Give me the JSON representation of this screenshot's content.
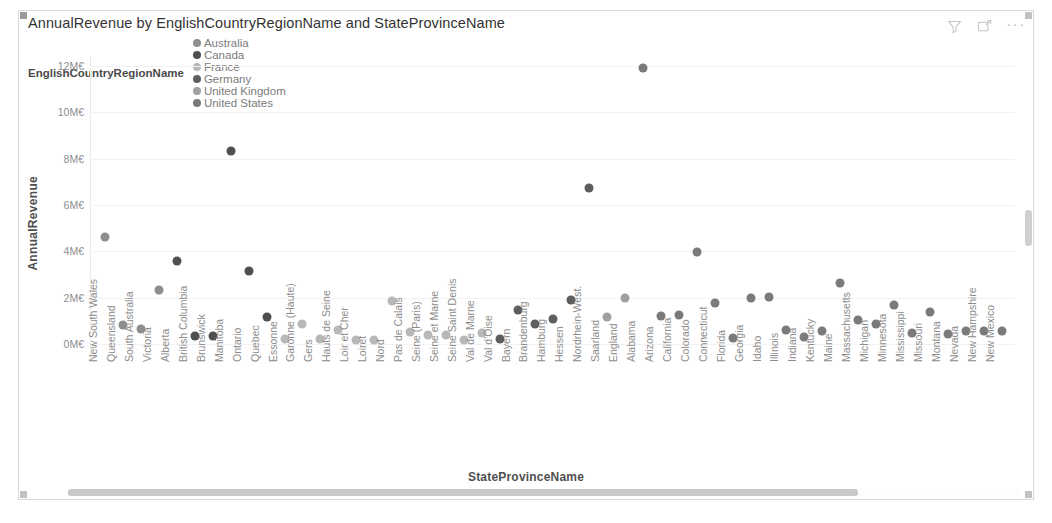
{
  "visual": {
    "title": "AnnualRevenue by EnglishCountryRegionName and StateProvinceName",
    "header_actions": [
      {
        "name": "filter-icon",
        "label": "Filters"
      },
      {
        "name": "focus-mode-icon",
        "label": "Focus mode"
      },
      {
        "name": "more-options-icon",
        "label": "···"
      }
    ]
  },
  "legend": {
    "title": "EnglishCountryRegionName",
    "items": [
      {
        "label": "Australia",
        "color": "#8e8e8e"
      },
      {
        "label": "Canada",
        "color": "#4f4f4f"
      },
      {
        "label": "France",
        "color": "#b8b8b8"
      },
      {
        "label": "Germany",
        "color": "#5e5e5e"
      },
      {
        "label": "United Kingdom",
        "color": "#a0a0a0"
      },
      {
        "label": "United States",
        "color": "#7a7a7a"
      }
    ]
  },
  "scrollbars": {
    "horizontal_visible": true,
    "vertical_visible": true
  },
  "chart_data": {
    "type": "scatter",
    "title": "AnnualRevenue by EnglishCountryRegionName and StateProvinceName",
    "xlabel": "StateProvinceName",
    "ylabel": "AnnualRevenue",
    "grid": true,
    "legend_position": "top",
    "ylim": [
      0,
      12000000
    ],
    "ytick_labels": [
      "0M€",
      "2M€",
      "4M€",
      "6M€",
      "8M€",
      "10M€",
      "12M€"
    ],
    "ytick_values": [
      0,
      2000000,
      4000000,
      6000000,
      8000000,
      10000000,
      12000000
    ],
    "categories": [
      "New South Wales",
      "Queensland",
      "South Australia",
      "Victoria",
      "Alberta",
      "British Columbia",
      "Brunswick",
      "Manitoba",
      "Ontario",
      "Quebec",
      "Essonne",
      "Garonne (Haute)",
      "Gers",
      "Hauts de Seine",
      "Loir et Cher",
      "Loiret",
      "Nord",
      "Pas de Calais",
      "Seine (Paris)",
      "Seine et Marne",
      "Seine Saint Denis",
      "Val de Marne",
      "Val d'Oise",
      "Bayern",
      "Brandenburg",
      "Hamburg",
      "Hessen",
      "Nordrhein-West.",
      "Saarland",
      "England",
      "Alabama",
      "Arizona",
      "California",
      "Colorado",
      "Connecticut",
      "Florida",
      "Georgia",
      "Idaho",
      "Illinois",
      "Indiana",
      "Kentucky",
      "Maine",
      "Massachusetts",
      "Michigan",
      "Minnesota",
      "Mississippi",
      "Missouri",
      "Montana",
      "Nevada",
      "New Hampshire",
      "New Mexico"
    ],
    "series": [
      {
        "name": "Australia",
        "color": "#8e8e8e",
        "points": [
          {
            "x": "New South Wales",
            "y": 4600000
          },
          {
            "x": "Queensland",
            "y": 800000
          },
          {
            "x": "South Australia",
            "y": 660000
          },
          {
            "x": "Victoria",
            "y": 2350000
          }
        ]
      },
      {
        "name": "Canada",
        "color": "#4f4f4f",
        "points": [
          {
            "x": "Alberta",
            "y": 3570000
          },
          {
            "x": "British Columbia",
            "y": 330000
          },
          {
            "x": "Brunswick",
            "y": 330000
          },
          {
            "x": "Manitoba",
            "y": 8350000
          },
          {
            "x": "Ontario",
            "y": 3150000
          },
          {
            "x": "Quebec",
            "y": 1150000
          }
        ]
      },
      {
        "name": "France",
        "color": "#b8b8b8",
        "points": [
          {
            "x": "Essonne",
            "y": 200000
          },
          {
            "x": "Garonne (Haute)",
            "y": 870000
          },
          {
            "x": "Gers",
            "y": 230000
          },
          {
            "x": "Hauts de Seine",
            "y": 600000
          },
          {
            "x": "Loir et Cher",
            "y": 180000
          },
          {
            "x": "Loiret",
            "y": 180000
          },
          {
            "x": "Nord",
            "y": 1850000
          },
          {
            "x": "Pas de Calais",
            "y": 500000
          },
          {
            "x": "Seine (Paris)",
            "y": 400000
          },
          {
            "x": "Seine et Marne",
            "y": 400000
          },
          {
            "x": "Seine Saint Denis",
            "y": 180000
          },
          {
            "x": "Val de Marne",
            "y": 480000
          }
        ]
      },
      {
        "name": "Germany",
        "color": "#5e5e5e",
        "points": [
          {
            "x": "Val d'Oise",
            "y": 230000
          },
          {
            "x": "Bayern",
            "y": 1470000
          },
          {
            "x": "Brandenburg",
            "y": 850000
          },
          {
            "x": "Hamburg",
            "y": 1100000
          },
          {
            "x": "Hessen",
            "y": 1900000
          },
          {
            "x": "Nordrhein-West.",
            "y": 6750000
          }
        ]
      },
      {
        "name": "United Kingdom",
        "color": "#a0a0a0",
        "points": [
          {
            "x": "Saarland",
            "y": 1150000
          },
          {
            "x": "England",
            "y": 2000000
          }
        ]
      },
      {
        "name": "United States",
        "color": "#7a7a7a",
        "points": [
          {
            "x": "Alabama",
            "y": 11900000
          },
          {
            "x": "Arizona",
            "y": 1220000
          },
          {
            "x": "California",
            "y": 1260000
          },
          {
            "x": "Colorado",
            "y": 3980000
          },
          {
            "x": "Connecticut",
            "y": 1750000
          },
          {
            "x": "Florida",
            "y": 280000
          },
          {
            "x": "Georgia",
            "y": 1980000
          },
          {
            "x": "Idaho",
            "y": 2020000
          },
          {
            "x": "Illinois",
            "y": 600000
          },
          {
            "x": "Indiana",
            "y": 320000
          },
          {
            "x": "Kentucky",
            "y": 580000
          },
          {
            "x": "Maine",
            "y": 2630000
          },
          {
            "x": "Massachusetts",
            "y": 1050000
          },
          {
            "x": "Michigan",
            "y": 880000
          },
          {
            "x": "Minnesota",
            "y": 1680000
          },
          {
            "x": "Mississippi",
            "y": 480000
          },
          {
            "x": "Missouri",
            "y": 1380000
          },
          {
            "x": "Montana",
            "y": 440000
          },
          {
            "x": "Nevada",
            "y": 560000
          },
          {
            "x": "New Hampshire",
            "y": 560000
          },
          {
            "x": "New Mexico",
            "y": 560000
          }
        ]
      }
    ]
  }
}
